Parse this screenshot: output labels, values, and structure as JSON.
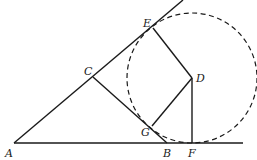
{
  "diagram": {
    "points": {
      "A": {
        "label": "A",
        "x": 14,
        "y": 143
      },
      "B": {
        "label": "B",
        "x": 167,
        "y": 143
      },
      "C": {
        "label": "C",
        "x": 93,
        "y": 77
      },
      "D": {
        "label": "D",
        "x": 192,
        "y": 78
      },
      "E": {
        "label": "E",
        "x": 153,
        "y": 28
      },
      "F": {
        "label": "F",
        "x": 192,
        "y": 143
      },
      "G": {
        "label": "G",
        "x": 152,
        "y": 126
      }
    },
    "segments": [
      [
        "A",
        "F"
      ],
      [
        "A",
        "E"
      ],
      [
        "C",
        "B"
      ],
      [
        "E",
        "D"
      ],
      [
        "D",
        "G"
      ],
      [
        "D",
        "F"
      ]
    ],
    "circle": {
      "center": "D",
      "radius": 65,
      "style": "dashed"
    }
  }
}
